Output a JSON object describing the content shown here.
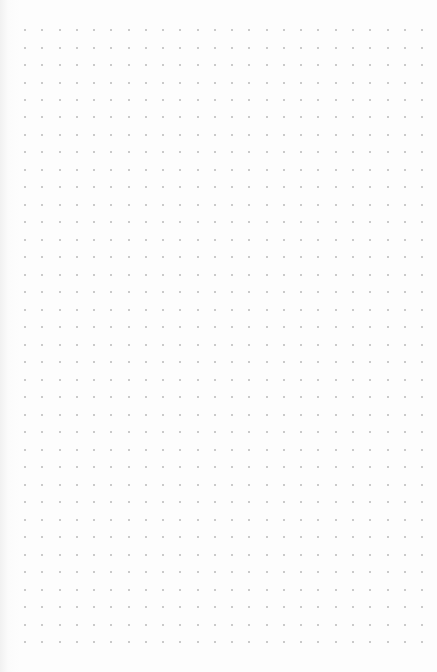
{
  "page": {
    "type": "dot-grid-paper",
    "background_color": "#fdfdfd",
    "dot_color": "#b9b9b9"
  },
  "grid": {
    "columns": 24,
    "rows": 36,
    "origin_x": 25,
    "origin_y": 30,
    "spacing_x": 17.26,
    "spacing_y": 17.49,
    "dot_size": 2
  }
}
